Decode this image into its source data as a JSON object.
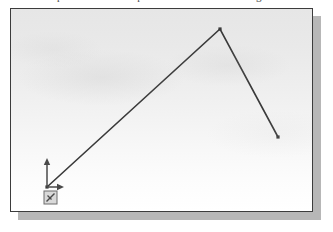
{
  "caption": {
    "text": "Repeat the above steps and create additional segments"
  },
  "figure": {
    "name": "cad-viewport",
    "frame": {
      "x": 10,
      "y": 8,
      "width": 303,
      "height": 204
    },
    "shadow_color": "#b7b7b7",
    "border_color": "#3c3c3c",
    "background_top_color": "#e6e6e6",
    "background_bottom_color": "#ffffff"
  },
  "chart_data": {
    "type": "line",
    "title": "",
    "subtitle": "",
    "xlabel": "",
    "ylabel": "",
    "grid": false,
    "legend": null,
    "xlim": [
      0,
      303
    ],
    "ylim": [
      0,
      204
    ],
    "series": [
      {
        "name": "polyline",
        "color": "#3a3a3a",
        "line_width": 1.6,
        "marker": "square",
        "marker_size": 3.2,
        "points": [
          {
            "label": "origin-vertex",
            "x": 36,
            "y": 178
          },
          {
            "label": "peak-vertex",
            "x": 209,
            "y": 20
          },
          {
            "label": "end-vertex",
            "x": 267,
            "y": 128
          }
        ]
      }
    ],
    "annotations": [
      {
        "name": "ucs-icon",
        "kind": "coordinate-axes",
        "origin": {
          "x": 36,
          "y": 178
        },
        "x_axis_end": {
          "x": 53,
          "y": 178
        },
        "y_axis_end": {
          "x": 36,
          "y": 149
        },
        "color": "#4a4a4a"
      },
      {
        "name": "pickbox-cursor",
        "kind": "pickbox",
        "x": 33,
        "y": 182,
        "width": 13,
        "height": 13,
        "color": "#6d6d6d",
        "fill": "#d9d9d9"
      }
    ]
  }
}
